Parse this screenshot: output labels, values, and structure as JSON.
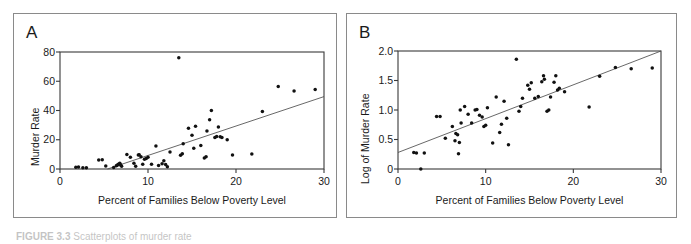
{
  "figure": {
    "caption_label": "FIGURE 3.3",
    "caption_text": "Scatterplots of murder rate",
    "background_color": "#ffffff",
    "frame_color": "#8a8a8a",
    "point_color": "#111111",
    "line_color": "#4d4d4d"
  },
  "panels": [
    {
      "letter": "A",
      "chart_ref": 0
    },
    {
      "letter": "B",
      "chart_ref": 1
    }
  ],
  "chart_data": [
    {
      "type": "scatter",
      "panel": "A",
      "title": "",
      "xlabel": "Percent of Families Below Poverty Level",
      "ylabel": "Murder Rate",
      "xlim": [
        0,
        30
      ],
      "ylim": [
        0,
        80
      ],
      "xticks": [
        0,
        10,
        20,
        30
      ],
      "xtick_labels": [
        "0",
        "10",
        "20",
        "30"
      ],
      "yticks": [
        0,
        20,
        40,
        60,
        80
      ],
      "ytick_labels": [
        "0",
        "20",
        "40",
        "60",
        "80"
      ],
      "grid": false,
      "legend": null,
      "trendline": {
        "type": "linear-fit",
        "x_start": 5.4,
        "y_start": 0.0,
        "x_end": 30.0,
        "y_end": 49.5
      },
      "x": [
        1.8,
        2.1,
        2.6,
        3.0,
        4.4,
        4.8,
        5.2,
        6.1,
        6.4,
        6.5,
        6.6,
        6.7,
        6.8,
        6.9,
        7.0,
        7.6,
        8.0,
        8.4,
        8.6,
        8.9,
        9.0,
        9.2,
        9.4,
        9.6,
        9.8,
        10.0,
        10.4,
        10.9,
        11.2,
        11.6,
        11.8,
        12.0,
        12.2,
        12.5,
        13.5,
        13.7,
        13.9,
        14.0,
        14.6,
        15.0,
        15.2,
        15.4,
        16.0,
        16.4,
        16.6,
        16.7,
        17.0,
        17.2,
        17.6,
        17.8,
        18.0,
        18.2,
        18.4,
        19.0,
        19.6,
        21.8,
        23.0,
        24.8,
        26.6,
        29.0
      ],
      "y": [
        1.2,
        1.3,
        0.8,
        0.9,
        6.2,
        6.4,
        2.0,
        1.0,
        2.2,
        2.6,
        3.0,
        3.4,
        4.0,
        2.8,
        1.8,
        10.0,
        8.0,
        4.0,
        1.8,
        9.6,
        9.8,
        8.4,
        3.2,
        6.6,
        7.2,
        8.0,
        3.2,
        15.8,
        2.4,
        3.6,
        5.6,
        3.0,
        1.6,
        11.6,
        76.0,
        9.4,
        10.4,
        17.2,
        27.8,
        23.0,
        14.2,
        29.2,
        16.0,
        7.6,
        8.4,
        26.0,
        33.6,
        40.0,
        21.6,
        22.2,
        28.8,
        22.0,
        21.6,
        20.0,
        9.6,
        10.2,
        39.4,
        56.4,
        53.4,
        54.4
      ]
    },
    {
      "type": "scatter",
      "panel": "B",
      "title": "",
      "xlabel": "Percent of Families Below Poverty Level",
      "ylabel": "Log of Murder Rate",
      "xlim": [
        0,
        30
      ],
      "ylim": [
        0,
        2.0
      ],
      "xticks": [
        0,
        10,
        20,
        30
      ],
      "xtick_labels": [
        "0",
        "10",
        "20",
        "30"
      ],
      "yticks": [
        0,
        0.5,
        1.0,
        1.5,
        2.0
      ],
      "ytick_labels": [
        "0",
        "0.5",
        "1.0",
        "1.5",
        "2.0"
      ],
      "grid": false,
      "legend": null,
      "trendline": {
        "type": "linear-fit",
        "x_start": 0.0,
        "y_start": 0.28,
        "x_end": 30.0,
        "y_end": 2.0
      },
      "x": [
        1.8,
        2.1,
        2.6,
        3.0,
        4.4,
        4.8,
        5.4,
        6.2,
        6.5,
        6.6,
        6.8,
        6.9,
        7.0,
        7.1,
        7.2,
        7.6,
        8.0,
        8.4,
        8.8,
        9.0,
        9.3,
        9.6,
        9.8,
        10.0,
        10.2,
        10.8,
        11.2,
        11.6,
        11.8,
        12.1,
        12.4,
        12.6,
        13.5,
        13.8,
        14.0,
        14.2,
        14.8,
        15.0,
        15.2,
        15.6,
        16.0,
        16.4,
        16.6,
        16.7,
        17.0,
        17.2,
        17.4,
        17.8,
        18.0,
        18.2,
        18.4,
        19.0,
        21.8,
        23.0,
        24.8,
        26.6,
        29.0
      ],
      "y": [
        0.28,
        0.27,
        0.0,
        0.27,
        0.89,
        0.89,
        0.52,
        0.72,
        0.48,
        0.6,
        0.58,
        0.26,
        0.45,
        1.0,
        0.78,
        1.06,
        0.93,
        0.78,
        1.0,
        1.01,
        0.91,
        0.88,
        0.72,
        0.74,
        1.04,
        0.44,
        1.22,
        0.62,
        0.76,
        1.15,
        0.86,
        0.41,
        1.86,
        0.98,
        1.06,
        1.2,
        1.42,
        1.35,
        1.46,
        1.2,
        1.23,
        1.48,
        1.58,
        1.52,
        0.98,
        1.0,
        1.22,
        1.47,
        1.58,
        1.34,
        1.37,
        1.31,
        1.05,
        1.57,
        1.72,
        1.7,
        1.71
      ]
    }
  ]
}
